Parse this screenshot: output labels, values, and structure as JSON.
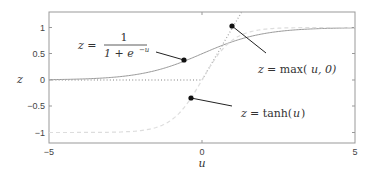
{
  "chart_data": {
    "type": "line",
    "title": "",
    "xlabel": "u",
    "ylabel": "z",
    "xlim": [
      -5,
      5
    ],
    "ylim": [
      -1.3,
      1.3
    ],
    "x_ticks": [
      -5,
      0,
      5
    ],
    "x_tick_labels": [
      "−5",
      "0",
      "5"
    ],
    "y_ticks": [
      1,
      0.5,
      0,
      -0.5,
      -1
    ],
    "y_tick_labels": [
      "1",
      "0.5",
      "0",
      "−0.5",
      "−1"
    ],
    "grid": false,
    "legend": "none (inline annotations)",
    "series": [
      {
        "name": "sigmoid",
        "label": "z = 1/(1+e^{-u})",
        "style": "solid gray",
        "color": "#999999",
        "x": [
          -5,
          -4,
          -3,
          -2,
          -1,
          0,
          1,
          2,
          3,
          4,
          5
        ],
        "values": [
          0.007,
          0.018,
          0.047,
          0.119,
          0.269,
          0.5,
          0.731,
          0.881,
          0.953,
          0.982,
          0.993
        ]
      },
      {
        "name": "relu",
        "label": "z = max(u, 0)",
        "style": "dotted gray",
        "color": "#aaaaaa",
        "x": [
          -5,
          0,
          1.3
        ],
        "values": [
          0,
          0,
          1.3
        ]
      },
      {
        "name": "tanh",
        "label": "z = tanh(u)",
        "style": "dashed light gray",
        "color": "#dddddd",
        "x": [
          -5,
          -4,
          -3,
          -2,
          -1,
          0,
          1,
          2,
          3,
          4,
          5
        ],
        "values": [
          -1.0,
          -0.999,
          -0.995,
          -0.964,
          -0.762,
          0,
          0.762,
          0.964,
          0.995,
          0.999,
          1.0
        ]
      }
    ],
    "annotations": [
      {
        "text": "z = 1 / (1 + e^{-u})",
        "points_to": {
          "u": -0.6,
          "z": 0.38
        }
      },
      {
        "text": "z = max(u, 0)",
        "points_to": {
          "u": 1.0,
          "z": 1.0
        }
      },
      {
        "text": "z = tanh(u)",
        "points_to": {
          "u": -0.35,
          "z": -0.34
        }
      }
    ]
  },
  "labels": {
    "xlabel": "u",
    "ylabel": "z",
    "sigmoid_lhs": "z =",
    "sigmoid_num": "1",
    "sigmoid_den": "1 + e",
    "sigmoid_exp": "−u",
    "relu": "z = max(u, 0)",
    "relu_lhs": "z",
    "relu_rhs": "= max(",
    "relu_args": "u, 0)",
    "tanh_lhs": "z",
    "tanh_rhs": "= tanh(",
    "tanh_arg": "u",
    "tanh_close": ")"
  }
}
